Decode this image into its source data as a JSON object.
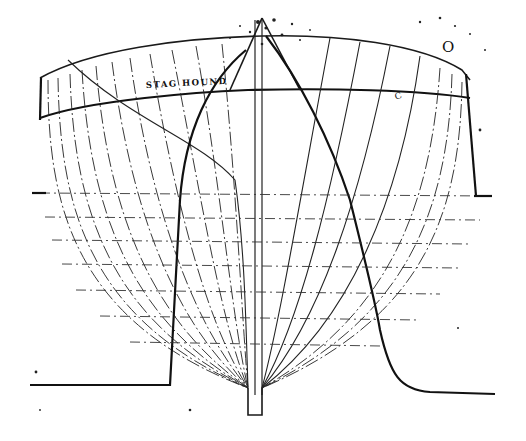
{
  "drawing": {
    "type": "ship body plan (half-breadth sections)",
    "title_label": "STAG HOUND",
    "corner_mark": "O",
    "station_mark": "C",
    "colors": {
      "ink": "#111111",
      "paper": "#ffffff"
    },
    "elements": {
      "sheer_line": "upper deck curve",
      "rail_line": "lower sheer / rail line with label",
      "stations_aft": 14,
      "stations_fore": 9,
      "waterlines": 6,
      "keel": "rectangular keel at bottom center",
      "profile_left": "stern rabbet profile with flat base",
      "profile_right": "stem profile curving to flat base"
    }
  }
}
